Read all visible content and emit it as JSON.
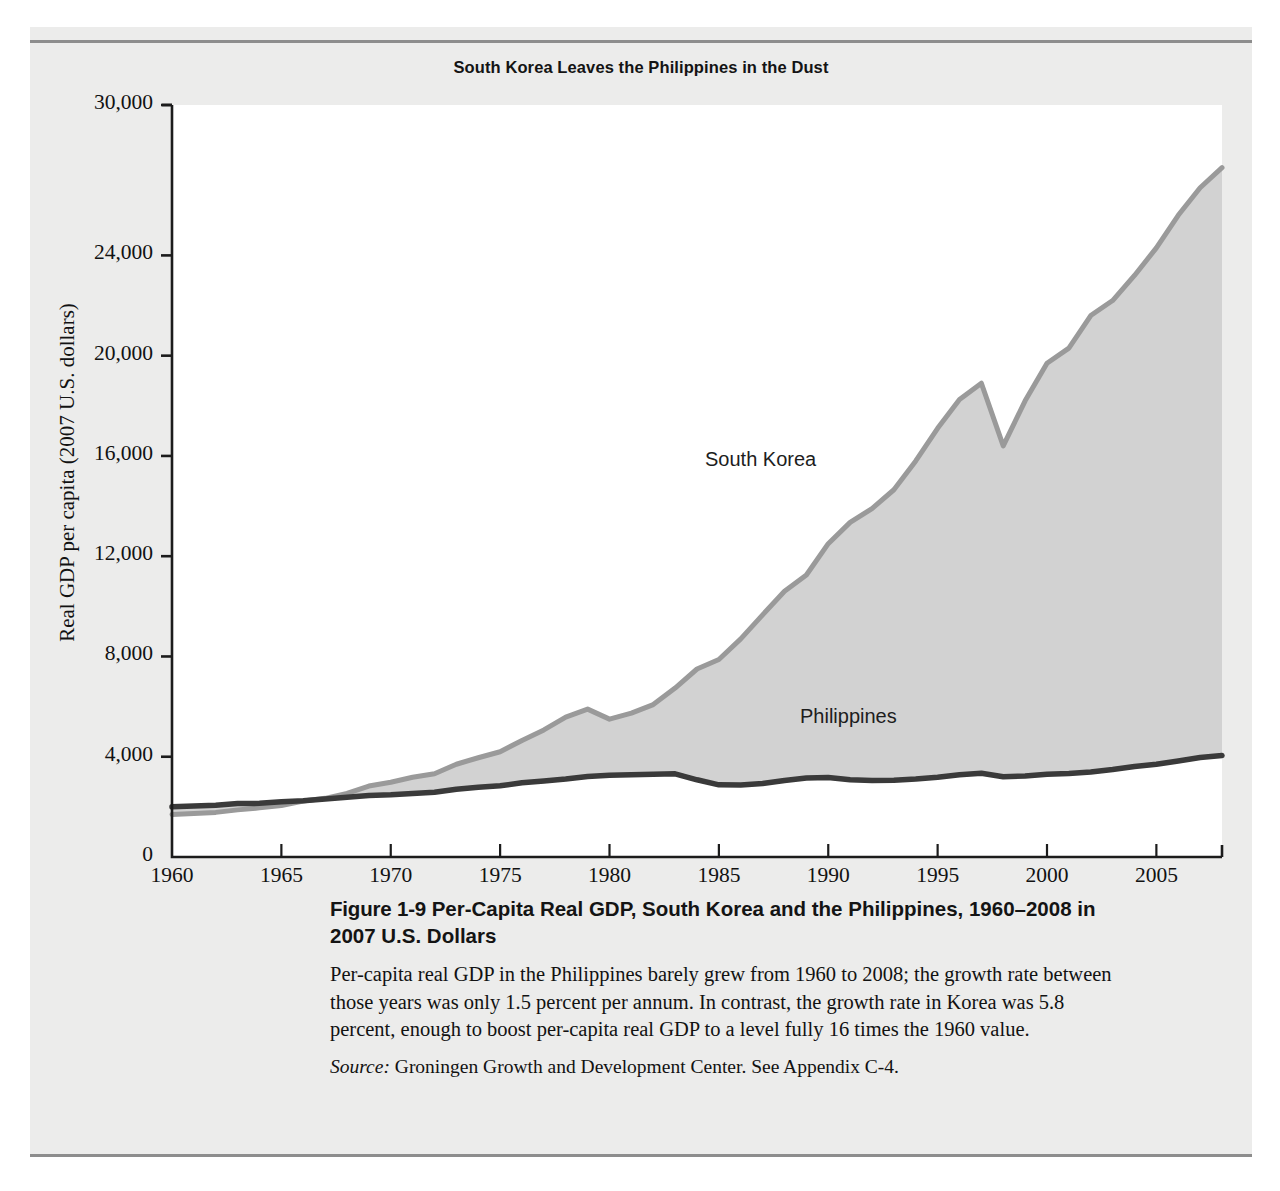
{
  "figure": {
    "chart_title": "South Korea Leaves the Philippines in the Dust",
    "caption_number": "Figure 1-9",
    "caption_title": "Per-Capita Real GDP, South Korea and the Philippines, 1960–2008 in 2007 U.S. Dollars",
    "caption_body": "Per-capita real GDP in the Philippines barely grew from 1960 to 2008; the growth rate between those years was only 1.5 percent per annum. In contrast, the growth rate in Korea was 5.8 percent, enough to boost per-capita real GDP to a level fully 16 times the 1960 value.",
    "source_word": "Source:",
    "source_text": " Groningen Growth and Development Center. See Appendix C-4."
  },
  "colors": {
    "page_background": "#ffffff",
    "panel_background": "#ececeb",
    "plot_background": "#ffffff",
    "rule": "#8d8d8d",
    "area_fill": "#d2d2d2",
    "korea_line": "#9a9a9a",
    "philippines_line": "#3a3a3a",
    "axis": "#1c1c1c",
    "text": "#141414"
  },
  "chart_data": {
    "type": "area",
    "title": "South Korea Leaves the Philippines in the Dust",
    "xlabel": "",
    "ylabel": "Real GDP per capita (2007 U.S. dollars)",
    "xlim": [
      1960,
      2008
    ],
    "ylim": [
      0,
      30000
    ],
    "grid": false,
    "legend": "inline-labels",
    "y_ticks": [
      0,
      4000,
      8000,
      12000,
      16000,
      20000,
      24000,
      30000
    ],
    "y_tick_labels": [
      "0",
      "4,000",
      "8,000",
      "12,000",
      "16,000",
      "20,000",
      "24,000",
      "30,000"
    ],
    "x_ticks": [
      1960,
      1965,
      1970,
      1975,
      1980,
      1985,
      1990,
      1995,
      2000,
      2005
    ],
    "x_tick_labels": [
      "1960",
      "1965",
      "1970",
      "1975",
      "1980",
      "1985",
      "1990",
      "1995",
      "2000",
      "2005"
    ],
    "x": [
      1960,
      1961,
      1962,
      1963,
      1964,
      1965,
      1966,
      1967,
      1968,
      1969,
      1970,
      1971,
      1972,
      1973,
      1974,
      1975,
      1976,
      1977,
      1978,
      1979,
      1980,
      1981,
      1982,
      1983,
      1984,
      1985,
      1986,
      1987,
      1988,
      1989,
      1990,
      1991,
      1992,
      1993,
      1994,
      1995,
      1996,
      1997,
      1998,
      1999,
      2000,
      2001,
      2002,
      2003,
      2004,
      2005,
      2006,
      2007,
      2008
    ],
    "series": [
      {
        "name": "South Korea",
        "color": "#9a9a9a",
        "values": [
          1700,
          1740,
          1780,
          1880,
          1960,
          2050,
          2230,
          2340,
          2540,
          2830,
          2980,
          3180,
          3320,
          3700,
          3960,
          4200,
          4650,
          5070,
          5580,
          5900,
          5500,
          5740,
          6080,
          6740,
          7500,
          7880,
          8700,
          9660,
          10600,
          11250,
          12500,
          13350,
          13900,
          14650,
          15800,
          17100,
          18250,
          18900,
          16400,
          18200,
          19700,
          20300,
          21600,
          22200,
          23200,
          24300,
          25600,
          26700,
          27500
        ]
      },
      {
        "name": "Philippines",
        "color": "#3a3a3a",
        "values": [
          2000,
          2030,
          2060,
          2130,
          2140,
          2200,
          2240,
          2310,
          2380,
          2450,
          2480,
          2530,
          2580,
          2700,
          2780,
          2840,
          2960,
          3030,
          3110,
          3210,
          3260,
          3280,
          3300,
          3320,
          3080,
          2880,
          2870,
          2930,
          3050,
          3150,
          3170,
          3080,
          3050,
          3060,
          3110,
          3180,
          3280,
          3340,
          3200,
          3230,
          3300,
          3330,
          3390,
          3490,
          3610,
          3700,
          3830,
          3970,
          4050
        ]
      }
    ],
    "annotations": [
      {
        "text": "South Korea",
        "x": 1985,
        "y": 14200
      },
      {
        "text": "Philippines",
        "x": 1990,
        "y": 5100
      }
    ]
  }
}
